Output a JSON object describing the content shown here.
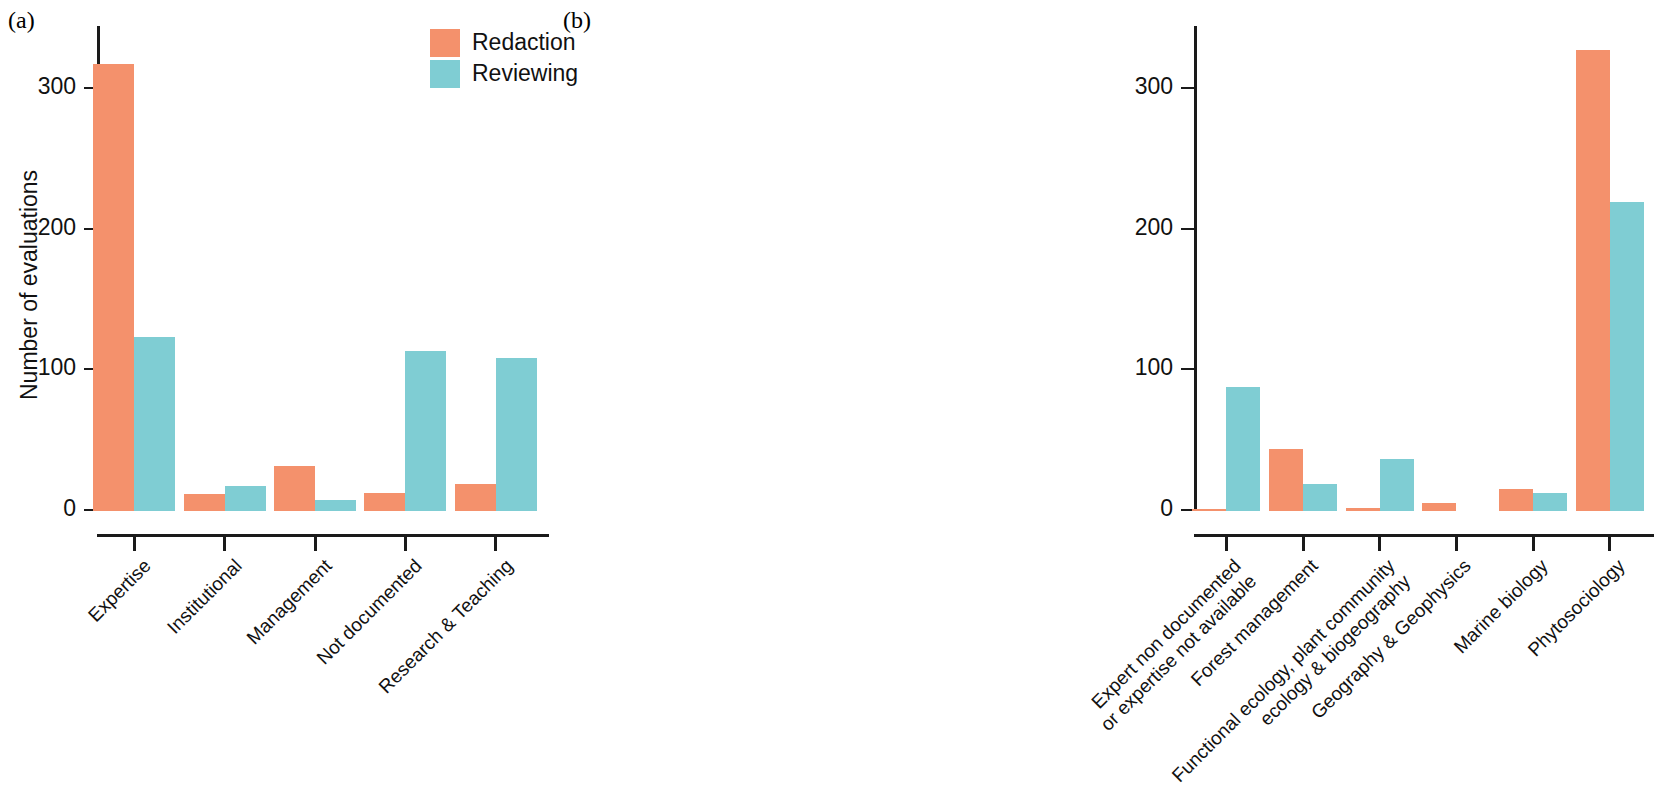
{
  "figure": {
    "panels": [
      {
        "tag": "(a)"
      },
      {
        "tag": "(b)"
      }
    ],
    "legend": {
      "items": [
        {
          "label": "Redaction",
          "color": "#f4916c",
          "swatch": "redaction-swatch"
        },
        {
          "label": "Reviewing",
          "color": "#7fcdd3",
          "swatch": "reviewing-swatch"
        }
      ]
    }
  },
  "chart_data": [
    {
      "type": "bar",
      "panel": "(a)",
      "title": "",
      "xlabel": "",
      "ylabel": "Number of evaluations",
      "ylim": [
        0,
        345
      ],
      "yticks": [
        0,
        100,
        200,
        300
      ],
      "ytick_labels": [
        "0",
        "100",
        "200",
        "300"
      ],
      "grid": false,
      "legend_position": "top-right",
      "categories": [
        "Expertise",
        "Institutional",
        "Management",
        "Not documented",
        "Research & Teaching"
      ],
      "series": [
        {
          "name": "Redaction",
          "color": "#f4916c",
          "values": [
            318,
            12,
            32,
            13,
            19
          ]
        },
        {
          "name": "Reviewing",
          "color": "#7fcdd3",
          "values": [
            124,
            18,
            8,
            114,
            109
          ]
        }
      ]
    },
    {
      "type": "bar",
      "panel": "(b)",
      "title": "",
      "xlabel": "",
      "ylabel": "",
      "ylim": [
        0,
        345
      ],
      "yticks": [
        0,
        100,
        200,
        300
      ],
      "ytick_labels": [
        "0",
        "100",
        "200",
        "300"
      ],
      "grid": false,
      "legend_position": "none",
      "categories": [
        "Expert non documented or expertise not available",
        "Forest management",
        "Functional ecology, plant community ecology & biogeography",
        "Geography & Geophysics",
        "Marine biology",
        "Phytosociology"
      ],
      "category_lines": [
        [
          "Expert non documented",
          "or expertise not available"
        ],
        [
          "Forest management"
        ],
        [
          "Functional ecology, plant community",
          "ecology & biogeography"
        ],
        [
          "Geography & Geophysics"
        ],
        [
          "Marine biology"
        ],
        [
          "Phytosociology"
        ]
      ],
      "series": [
        {
          "name": "Redaction",
          "color": "#f4916c",
          "values": [
            1,
            44,
            2,
            6,
            16,
            328
          ]
        },
        {
          "name": "Reviewing",
          "color": "#7fcdd3",
          "values": [
            88,
            19,
            37,
            0,
            13,
            220
          ]
        }
      ]
    }
  ]
}
